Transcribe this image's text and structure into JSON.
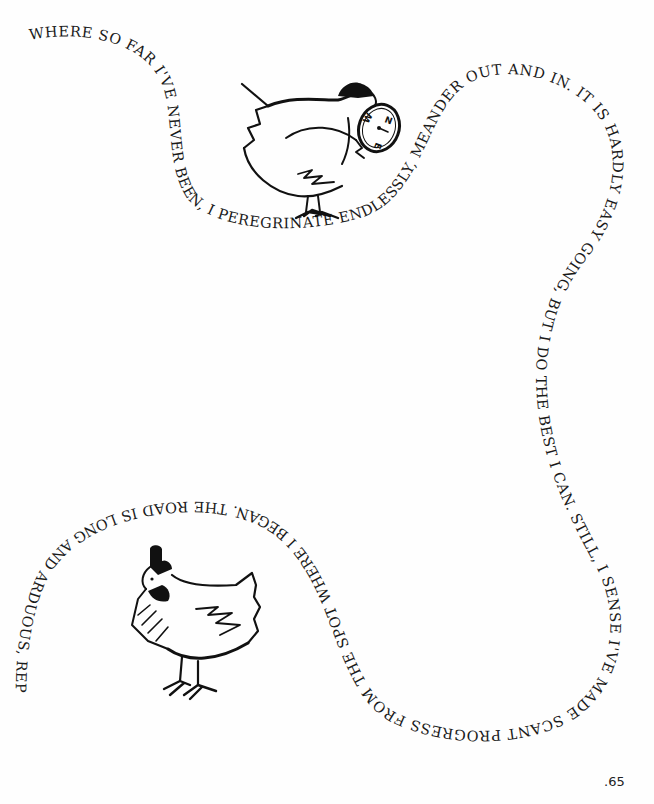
{
  "page": {
    "page_number": ".65",
    "background_color": "#fefefe",
    "ink_color": "#1a1a1a"
  },
  "flowing_text": {
    "content": "WHERE SO FAR I'VE NEVER BEEN, I PEREGRINATE ENDLESSLY, MEANDER OUT AND IN. IT IS HARDLY EASY GOING, BUT I DO THE BEST I CAN. STILL, I SENSE I'VE MADE SCANT PROGRESS FROM THE SPOT WHERE I BEGAN. THE ROAD IS LONG AND ARDUOUS, REPLETE"
  },
  "illustrations": [
    {
      "name": "hen-with-compass",
      "description": "Hen holding a compass marked W, N, E"
    },
    {
      "name": "standing-hen",
      "description": "Hen with dark comb standing, facing left"
    }
  ],
  "compass": {
    "labels": [
      "W",
      "N",
      "E"
    ]
  }
}
